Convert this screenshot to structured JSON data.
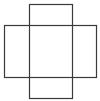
{
  "diagram": {
    "type": "cross-net",
    "stroke_color": "#3a3a3a",
    "background": "#ffffff",
    "shapes": [
      {
        "name": "vertical-rectangle",
        "x": 29.5,
        "y": 4.5,
        "width": 43,
        "height": 94
      },
      {
        "name": "horizontal-rectangle",
        "x": 4.5,
        "y": 25.5,
        "width": 92,
        "height": 52
      }
    ]
  }
}
